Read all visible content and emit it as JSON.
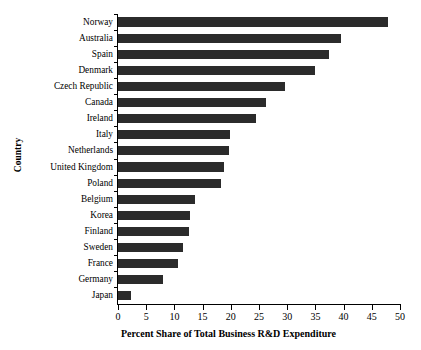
{
  "chart_data": {
    "type": "bar",
    "orientation": "horizontal",
    "title": "",
    "xlabel": "Percent Share of Total Business R&D Expenditure",
    "ylabel": "Country",
    "xlim": [
      0,
      50
    ],
    "xticks": [
      0,
      5,
      10,
      15,
      20,
      25,
      30,
      35,
      40,
      45,
      50
    ],
    "grid": false,
    "legend": null,
    "bar_color": "#2b2b2b",
    "categories": [
      "Norway",
      "Australia",
      "Spain",
      "Denmark",
      "Czech Republic",
      "Canada",
      "Ireland",
      "Italy",
      "Netherlands",
      "United Kingdom",
      "Poland",
      "Belgium",
      "Korea",
      "Finland",
      "Sweden",
      "France",
      "Germany",
      "Japan"
    ],
    "values": [
      47.9,
      39.6,
      37.4,
      35.0,
      29.6,
      26.3,
      24.5,
      19.8,
      19.6,
      18.8,
      18.2,
      13.7,
      12.7,
      12.5,
      11.6,
      10.7,
      7.9,
      2.3
    ]
  }
}
